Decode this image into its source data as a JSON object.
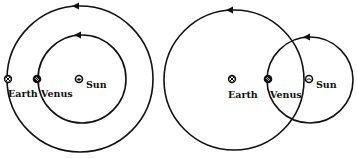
{
  "diagrams": [
    {
      "id": "heliocentric",
      "labels": {
        "earth": "Earth",
        "venus": "Venus",
        "sun": "Sun"
      }
    },
    {
      "id": "geocentric",
      "labels": {
        "earth": "Earth",
        "venus": "Venus",
        "sun": "Sun"
      }
    }
  ],
  "icons": {
    "earth": "earth-symbol-icon",
    "venus": "venus-symbol-icon",
    "sun": "sun-symbol-icon"
  },
  "colors": {
    "stroke": "#111111",
    "background": "#ffffff"
  }
}
